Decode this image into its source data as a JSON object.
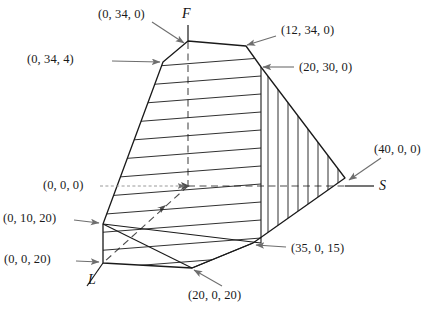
{
  "figure": {
    "background_color": "#ffffff",
    "line_color": "#1a1a1a",
    "annotation_color": "#6e6e6e",
    "dashed_color": "#4d4d4d"
  },
  "axes": [
    {
      "name": "F",
      "label": "F",
      "x": 182,
      "y": 14
    },
    {
      "name": "S",
      "label": "S",
      "x": 379,
      "y": 179
    },
    {
      "name": "L",
      "label": "L",
      "x": 92,
      "y": 281
    }
  ],
  "vertices": [
    {
      "id": "v-0-34-0",
      "label": "(0, 34, 0)",
      "label_x": 98,
      "label_y": 8,
      "tip_x": 186,
      "tip_y": 42,
      "arrow_from_x": 152,
      "arrow_from_y": 22
    },
    {
      "id": "v-12-34-0",
      "label": "(12, 34, 0)",
      "label_x": 281,
      "label_y": 24,
      "tip_x": 246,
      "tip_y": 46,
      "arrow_from_x": 276,
      "arrow_from_y": 36
    },
    {
      "id": "v-0-34-4",
      "label": "(0, 34, 4)",
      "label_x": 27,
      "label_y": 53,
      "tip_x": 163,
      "tip_y": 62,
      "arrow_from_x": 112,
      "arrow_from_y": 61
    },
    {
      "id": "v-20-30-0",
      "label": "(20, 30, 0)",
      "label_x": 299,
      "label_y": 61,
      "tip_x": 261,
      "tip_y": 67,
      "arrow_from_x": 294,
      "arrow_from_y": 67
    },
    {
      "id": "v-40-0-0",
      "label": "(40, 0, 0)",
      "label_x": 374,
      "label_y": 143,
      "tip_x": 345,
      "tip_y": 178,
      "arrow_from_x": 381,
      "arrow_from_y": 158
    },
    {
      "id": "v-0-0-0",
      "label": "(0, 0, 0)",
      "label_x": 43,
      "label_y": 178,
      "tip_x": 188,
      "tip_y": 186,
      "arrow_from_x": 100,
      "arrow_from_y": 186
    },
    {
      "id": "v-0-10-20",
      "label": "(0, 10, 20)",
      "label_x": 3,
      "label_y": 211,
      "tip_x": 100,
      "tip_y": 224,
      "arrow_from_x": 74,
      "arrow_from_y": 220
    },
    {
      "id": "v-35-0-15",
      "label": "(35, 0, 15)",
      "label_x": 291,
      "label_y": 242,
      "tip_x": 253,
      "tip_y": 243,
      "arrow_from_x": 286,
      "arrow_from_y": 247
    },
    {
      "id": "v-0-0-20",
      "label": "(0, 0, 20)",
      "label_x": 4,
      "label_y": 252,
      "tip_x": 100,
      "tip_y": 263,
      "arrow_from_x": 76,
      "arrow_from_y": 261
    },
    {
      "id": "v-20-0-20",
      "label": "(20, 0, 20)",
      "label_x": 188,
      "label_y": 288,
      "tip_x": 192,
      "tip_y": 268,
      "arrow_from_x": 222,
      "arrow_from_y": 286
    }
  ],
  "geometry": {
    "f_axis": {
      "x": 188,
      "y_top": 25,
      "y_bottom": 190
    },
    "s_axis": {
      "y": 186,
      "x_start": 188,
      "x_end": 374
    },
    "l_axis": {
      "x1": 103,
      "y1": 263,
      "x2": 87,
      "y2": 286
    },
    "outline": "188,41 246,46 261,67 345,178 253,243 192,268 103,263 103,224 163,62",
    "horizontal_hatch_count": 12,
    "vertical_hatch_count": 8
  }
}
